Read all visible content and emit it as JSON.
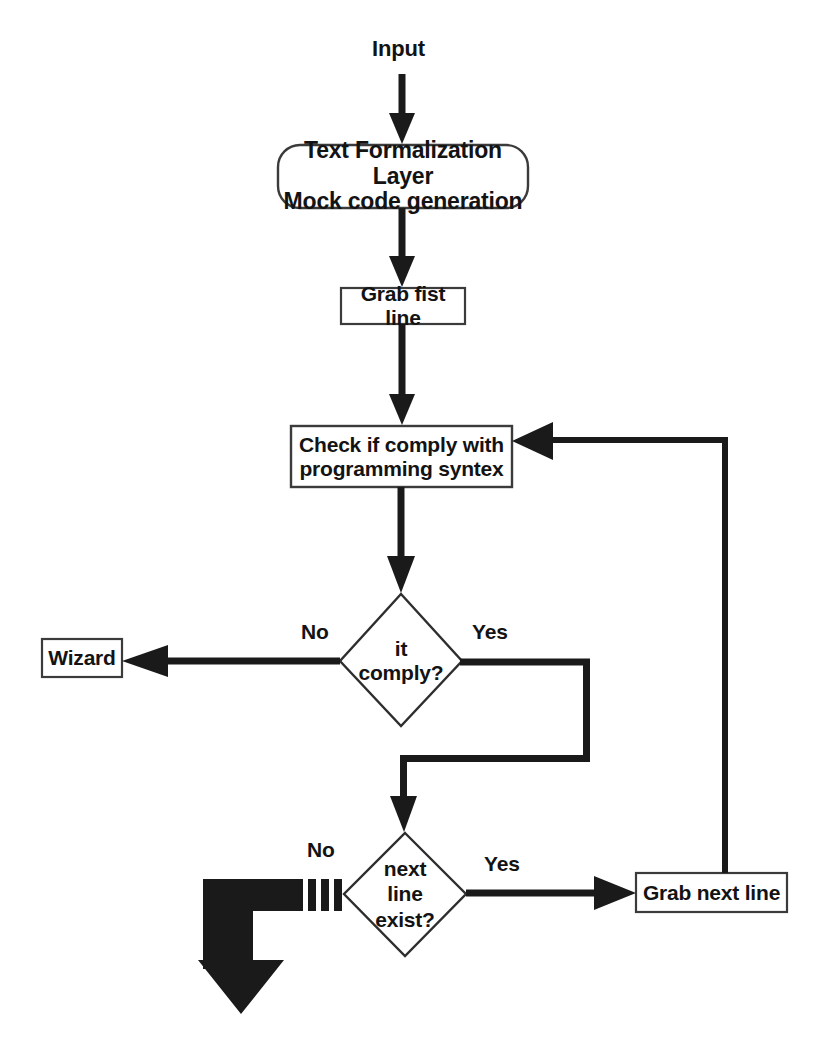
{
  "diagram": {
    "type": "flowchart",
    "background_color": "#ffffff",
    "line_color": "#1a1a1a",
    "text_color": "#131313",
    "node_fill": "#ffffff"
  },
  "nodes": {
    "input": {
      "id": "input",
      "shape": "label",
      "label": "Input"
    },
    "formalization": {
      "id": "formalization",
      "shape": "rounded-rectangle",
      "label": "Text Formalization Layer\nMock code generation"
    },
    "grab_first": {
      "id": "grab_first",
      "shape": "rectangle",
      "label": "Grab fist line"
    },
    "check_syntax": {
      "id": "check_syntax",
      "shape": "rectangle",
      "label": "Check if comply with\nprogramming syntex"
    },
    "it_comply": {
      "id": "it_comply",
      "shape": "diamond",
      "label": "it\ncomply?"
    },
    "wizard": {
      "id": "wizard",
      "shape": "rectangle",
      "label": "Wizard"
    },
    "next_line_exist": {
      "id": "next_line_exist",
      "shape": "diamond",
      "label": "next\nline\nexist?"
    },
    "grab_next": {
      "id": "grab_next",
      "shape": "rectangle",
      "label": "Grab next line"
    }
  },
  "edges": [
    {
      "id": "e-input-formalization",
      "from": "input",
      "to": "formalization",
      "label": ""
    },
    {
      "id": "e-formalization-grabfirst",
      "from": "formalization",
      "to": "grab_first",
      "label": ""
    },
    {
      "id": "e-grabfirst-check",
      "from": "grab_first",
      "to": "check_syntax",
      "label": ""
    },
    {
      "id": "e-check-comply",
      "from": "check_syntax",
      "to": "it_comply",
      "label": ""
    },
    {
      "id": "e-comply-wizard",
      "from": "it_comply",
      "to": "wizard",
      "label": "No"
    },
    {
      "id": "e-comply-nextline",
      "from": "it_comply",
      "to": "next_line_exist",
      "label": "Yes"
    },
    {
      "id": "e-nextline-grabnext",
      "from": "next_line_exist",
      "to": "grab_next",
      "label": "Yes"
    },
    {
      "id": "e-nextline-exit",
      "from": "next_line_exist",
      "to": "exit",
      "label": "No"
    },
    {
      "id": "e-grabnext-check",
      "from": "grab_next",
      "to": "check_syntax",
      "label": ""
    }
  ],
  "edge_labels": {
    "comply_no": "No",
    "comply_yes": "Yes",
    "nextline_no": "No",
    "nextline_yes": "Yes"
  }
}
